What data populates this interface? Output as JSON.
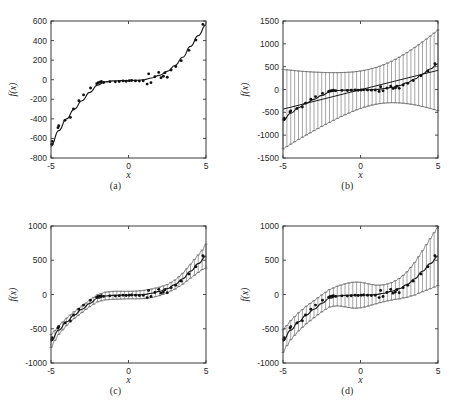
{
  "figure": {
    "title": "",
    "panel_count": 4,
    "background_color": "#ffffff",
    "line_color": "#1c1c1c",
    "marker_color": "#111111",
    "errorbar_color": "#5a5a5a"
  },
  "captions": {
    "a": "(a)",
    "b": "(b)",
    "c": "(c)",
    "d": "(d)"
  },
  "axis_labels": {
    "x": "x",
    "y": "f(x)"
  },
  "chart_data": [
    {
      "type": "scatter",
      "panel": "a",
      "title": "",
      "xlabel": "x",
      "ylabel": "f(x)",
      "xlim": [
        -5,
        5
      ],
      "ylim": [
        -800,
        600
      ],
      "xticks": [
        -5,
        0,
        5
      ],
      "xticklabels": [
        "-5",
        "0",
        "5"
      ],
      "yticks": [
        -800,
        -600,
        -400,
        -200,
        0,
        200,
        400,
        600
      ],
      "yticklabels": [
        "-800",
        "-600",
        "-400",
        "-200",
        "0",
        "200",
        "400",
        "600"
      ],
      "grid": false,
      "legend": false,
      "series": [
        {
          "name": "data points",
          "style": "scatter",
          "x": [
            -4.95,
            -4.92,
            -4.55,
            -4.5,
            -4.1,
            -3.75,
            -3.55,
            -3.2,
            -2.9,
            -2.45,
            -2.05,
            -1.95,
            -1.85,
            -1.75,
            -1.6,
            -1.2,
            -0.85,
            -0.6,
            -0.35,
            -0.15,
            0.05,
            0.2,
            0.45,
            0.7,
            0.95,
            1.2,
            1.3,
            1.45,
            1.7,
            1.95,
            2.1,
            2.25,
            2.35,
            2.5,
            2.75,
            3.05,
            3.4,
            3.9,
            4.35,
            4.8
          ],
          "y": [
            -660,
            -630,
            -490,
            -470,
            -415,
            -385,
            -300,
            -215,
            -155,
            -85,
            -40,
            -30,
            -25,
            -18,
            -28,
            -20,
            -22,
            -18,
            -12,
            -15,
            -10,
            -8,
            -12,
            -14,
            -10,
            -45,
            60,
            -30,
            30,
            75,
            20,
            35,
            70,
            25,
            100,
            135,
            195,
            300,
            405,
            565
          ]
        },
        {
          "name": "cubic fit",
          "style": "line",
          "description": "smooth cubic-like regression curve through the data",
          "x": [
            -5,
            -4.5,
            -4,
            -3.5,
            -3,
            -2.5,
            -2,
            -1.5,
            -1,
            -0.5,
            0,
            0.5,
            1,
            1.5,
            2,
            2.5,
            3,
            3.5,
            4,
            4.5,
            5
          ],
          "y": [
            -680,
            -520,
            -400,
            -300,
            -215,
            -130,
            -55,
            -22,
            -12,
            -10,
            -8,
            -6,
            0,
            18,
            45,
            85,
            145,
            230,
            340,
            450,
            560
          ]
        }
      ]
    },
    {
      "type": "scatter",
      "panel": "b",
      "title": "",
      "xlabel": "x",
      "ylabel": "f(x)",
      "xlim": [
        -5,
        5
      ],
      "ylim": [
        -1500,
        1500
      ],
      "xticks": [
        -5,
        0,
        5
      ],
      "xticklabels": [
        "-5",
        "0",
        "5"
      ],
      "yticks": [
        -1500,
        -1000,
        -500,
        0,
        500,
        1000,
        1500
      ],
      "yticklabels": [
        "-1500",
        "-1000",
        "-500",
        "0",
        "500",
        "1000",
        "1500"
      ],
      "grid": false,
      "legend": false,
      "errorbar_shape": "hourglass (linear-model prediction interval, widest at x=-5 and x=5, narrowest near x=1)",
      "series": [
        {
          "name": "data points",
          "style": "scatter",
          "x": [
            -4.95,
            -4.92,
            -4.55,
            -4.5,
            -4.1,
            -3.75,
            -3.55,
            -3.2,
            -2.9,
            -2.45,
            -2.05,
            -1.95,
            -1.85,
            -1.75,
            -1.6,
            -1.2,
            -0.85,
            -0.6,
            -0.35,
            -0.15,
            0.05,
            0.2,
            0.45,
            0.7,
            0.95,
            1.2,
            1.3,
            1.45,
            1.7,
            1.95,
            2.1,
            2.25,
            2.35,
            2.5,
            2.75,
            3.05,
            3.4,
            3.9,
            4.35,
            4.8
          ],
          "y": [
            -660,
            -630,
            -490,
            -470,
            -415,
            -385,
            -300,
            -215,
            -155,
            -85,
            -40,
            -30,
            -25,
            -18,
            -28,
            -20,
            -22,
            -18,
            -12,
            -15,
            -10,
            -8,
            -12,
            -14,
            -10,
            -45,
            60,
            -30,
            30,
            75,
            20,
            35,
            70,
            25,
            100,
            135,
            195,
            300,
            405,
            565
          ]
        },
        {
          "name": "linear fit",
          "style": "line",
          "description": "straight-line least squares fit",
          "x": [
            -5,
            5
          ],
          "y": [
            -430,
            420
          ]
        },
        {
          "name": "curve through data",
          "style": "line",
          "x": [
            -5,
            -4.5,
            -4,
            -3.5,
            -3,
            -2.5,
            -2,
            -1.5,
            -1,
            -0.5,
            0,
            0.5,
            1,
            1.5,
            2,
            2.5,
            3,
            3.5,
            4,
            4.5,
            5
          ],
          "y": [
            -680,
            -520,
            -400,
            -300,
            -215,
            -130,
            -55,
            -22,
            -12,
            -10,
            -8,
            -6,
            0,
            18,
            45,
            85,
            145,
            230,
            340,
            450,
            560
          ]
        },
        {
          "name": "error bars",
          "style": "errorbar",
          "x": [
            -5,
            -4.75,
            -4.5,
            -4.25,
            -4,
            -3.75,
            -3.5,
            -3.25,
            -3,
            -2.75,
            -2.5,
            -2.25,
            -2,
            -1.75,
            -1.5,
            -1.25,
            -1,
            -0.75,
            -0.5,
            -0.25,
            0,
            0.25,
            0.5,
            0.75,
            1,
            1.25,
            1.5,
            1.75,
            2,
            2.25,
            2.5,
            2.75,
            3,
            3.25,
            3.5,
            3.75,
            4,
            4.25,
            4.5,
            4.75,
            5
          ],
          "err": [
            870,
            840,
            810,
            780,
            750,
            722,
            695,
            668,
            642,
            617,
            592,
            568,
            545,
            523,
            502,
            482,
            464,
            447,
            432,
            420,
            410,
            404,
            400,
            400,
            403,
            410,
            421,
            436,
            454,
            476,
            501,
            529,
            560,
            593,
            629,
            667,
            707,
            749,
            793,
            838,
            885
          ]
        }
      ]
    },
    {
      "type": "scatter",
      "panel": "c",
      "title": "",
      "xlabel": "x",
      "ylabel": "f(x)",
      "xlim": [
        -5,
        5
      ],
      "ylim": [
        -1000,
        1000
      ],
      "xticks": [
        -5,
        0,
        5
      ],
      "xticklabels": [
        "-5",
        "0",
        "5"
      ],
      "yticks": [
        -1000,
        -500,
        0,
        500,
        1000
      ],
      "yticklabels": [
        "-1000",
        "-500",
        "0",
        "500",
        "1000"
      ],
      "grid": false,
      "legend": false,
      "errorbar_shape": "narrow band hugging the cubic curve, slightly wider at the extremes",
      "series": [
        {
          "name": "data points",
          "style": "scatter",
          "x": [
            -4.95,
            -4.92,
            -4.55,
            -4.5,
            -4.1,
            -3.75,
            -3.55,
            -3.2,
            -2.9,
            -2.45,
            -2.05,
            -1.95,
            -1.85,
            -1.75,
            -1.6,
            -1.2,
            -0.85,
            -0.6,
            -0.35,
            -0.15,
            0.05,
            0.2,
            0.45,
            0.7,
            0.95,
            1.2,
            1.3,
            1.45,
            1.7,
            1.95,
            2.1,
            2.25,
            2.35,
            2.5,
            2.75,
            3.05,
            3.4,
            3.9,
            4.35,
            4.8
          ],
          "y": [
            -660,
            -630,
            -490,
            -470,
            -415,
            -385,
            -300,
            -215,
            -155,
            -85,
            -40,
            -30,
            -25,
            -18,
            -28,
            -20,
            -22,
            -18,
            -12,
            -15,
            -10,
            -8,
            -12,
            -14,
            -10,
            -45,
            60,
            -30,
            30,
            75,
            20,
            35,
            70,
            25,
            100,
            135,
            195,
            300,
            405,
            565
          ]
        },
        {
          "name": "cubic fit",
          "style": "line",
          "x": [
            -5,
            -4.5,
            -4,
            -3.5,
            -3,
            -2.5,
            -2,
            -1.5,
            -1,
            -0.5,
            0,
            0.5,
            1,
            1.5,
            2,
            2.5,
            3,
            3.5,
            4,
            4.5,
            5
          ],
          "y": [
            -680,
            -520,
            -400,
            -300,
            -215,
            -130,
            -55,
            -22,
            -12,
            -10,
            -8,
            -6,
            0,
            18,
            45,
            85,
            145,
            230,
            340,
            450,
            560
          ]
        },
        {
          "name": "error bars",
          "style": "errorbar",
          "x": [
            -5,
            -4.75,
            -4.5,
            -4.25,
            -4,
            -3.75,
            -3.5,
            -3.25,
            -3,
            -2.75,
            -2.5,
            -2.25,
            -2,
            -1.75,
            -1.5,
            -1.25,
            -1,
            -0.75,
            -0.5,
            -0.25,
            0,
            0.25,
            0.5,
            0.75,
            1,
            1.25,
            1.5,
            1.75,
            2,
            2.25,
            2.5,
            2.75,
            3,
            3.25,
            3.5,
            3.75,
            4,
            4.25,
            4.5,
            4.75,
            5
          ],
          "err": [
            95,
            72,
            62,
            58,
            55,
            52,
            50,
            48,
            47,
            47,
            48,
            50,
            52,
            54,
            56,
            57,
            58,
            58,
            57,
            56,
            55,
            55,
            56,
            58,
            60,
            62,
            63,
            63,
            62,
            61,
            60,
            62,
            66,
            72,
            80,
            90,
            102,
            115,
            128,
            142,
            175
          ]
        }
      ]
    },
    {
      "type": "scatter",
      "panel": "d",
      "title": "",
      "xlabel": "x",
      "ylabel": "f(x)",
      "xlim": [
        -5,
        5
      ],
      "ylim": [
        -1000,
        1000
      ],
      "xticks": [
        -5,
        0,
        5
      ],
      "xticklabels": [
        "-5",
        "0",
        "5"
      ],
      "yticks": [
        -1000,
        -500,
        0,
        500,
        1000
      ],
      "yticklabels": [
        "-1000",
        "-500",
        "0",
        "500",
        "1000"
      ],
      "grid": false,
      "legend": false,
      "errorbar_shape": "moderate band around the cubic curve, bulging near x=-0.5 and widening strongly toward x=5",
      "series": [
        {
          "name": "data points",
          "style": "scatter",
          "x": [
            -4.95,
            -4.92,
            -4.55,
            -4.5,
            -4.1,
            -3.75,
            -3.55,
            -3.2,
            -2.9,
            -2.45,
            -2.05,
            -1.95,
            -1.85,
            -1.75,
            -1.6,
            -1.2,
            -0.85,
            -0.6,
            -0.35,
            -0.15,
            0.05,
            0.2,
            0.45,
            0.7,
            0.95,
            1.2,
            1.3,
            1.45,
            1.7,
            1.95,
            2.1,
            2.25,
            2.35,
            2.5,
            2.75,
            3.05,
            3.4,
            3.9,
            4.35,
            4.8
          ],
          "y": [
            -660,
            -630,
            -490,
            -470,
            -415,
            -385,
            -300,
            -215,
            -155,
            -85,
            -40,
            -30,
            -25,
            -18,
            -28,
            -20,
            -22,
            -18,
            -12,
            -15,
            -10,
            -8,
            -12,
            -14,
            -10,
            -45,
            60,
            -30,
            30,
            75,
            20,
            35,
            70,
            25,
            100,
            135,
            195,
            300,
            405,
            565
          ]
        },
        {
          "name": "cubic fit",
          "style": "line",
          "x": [
            -5,
            -4.5,
            -4,
            -3.5,
            -3,
            -2.5,
            -2,
            -1.5,
            -1,
            -0.5,
            0,
            0.5,
            1,
            1.5,
            2,
            2.5,
            3,
            3.5,
            4,
            4.5,
            5
          ],
          "y": [
            -680,
            -520,
            -400,
            -300,
            -215,
            -130,
            -55,
            -22,
            -12,
            -10,
            -8,
            -6,
            0,
            18,
            45,
            85,
            145,
            230,
            340,
            450,
            560
          ]
        },
        {
          "name": "error bars",
          "style": "errorbar",
          "x": [
            -5,
            -4.75,
            -4.5,
            -4.25,
            -4,
            -3.75,
            -3.5,
            -3.25,
            -3,
            -2.75,
            -2.5,
            -2.25,
            -2,
            -1.75,
            -1.5,
            -1.25,
            -1,
            -0.75,
            -0.5,
            -0.25,
            0,
            0.25,
            0.5,
            0.75,
            1,
            1.25,
            1.5,
            1.75,
            2,
            2.25,
            2.5,
            2.75,
            3,
            3.25,
            3.5,
            3.75,
            4,
            4.25,
            4.5,
            4.75,
            5
          ],
          "err": [
            165,
            148,
            140,
            136,
            133,
            130,
            128,
            126,
            125,
            124,
            124,
            125,
            128,
            134,
            143,
            155,
            168,
            180,
            188,
            190,
            186,
            176,
            162,
            148,
            136,
            128,
            124,
            124,
            128,
            136,
            148,
            165,
            186,
            210,
            238,
            268,
            300,
            333,
            366,
            398,
            430
          ]
        }
      ]
    }
  ]
}
